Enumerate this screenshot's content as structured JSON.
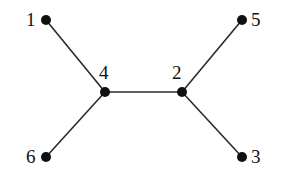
{
  "diagram": {
    "type": "undirected-graph",
    "title": "",
    "background_color": "#ffffff",
    "edge_color": "#2b2b2b",
    "vertex_color": "#101010",
    "label_color": "#111111",
    "vertex_radius": 5,
    "edge_width": 1.6,
    "vertices": [
      {
        "id": "1",
        "label": "1",
        "x": 46,
        "y": 20,
        "label_x": 26,
        "label_y": 10,
        "label_anchor": "left"
      },
      {
        "id": "2",
        "label": "2",
        "x": 182,
        "y": 92,
        "label_x": 172,
        "label_y": 63,
        "label_anchor": "above"
      },
      {
        "id": "3",
        "label": "3",
        "x": 242,
        "y": 157,
        "label_x": 251,
        "label_y": 147,
        "label_anchor": "right"
      },
      {
        "id": "4",
        "label": "4",
        "x": 105,
        "y": 92,
        "label_x": 99,
        "label_y": 63,
        "label_anchor": "above"
      },
      {
        "id": "5",
        "label": "5",
        "x": 242,
        "y": 20,
        "label_x": 251,
        "label_y": 10,
        "label_anchor": "right"
      },
      {
        "id": "6",
        "label": "6",
        "x": 46,
        "y": 157,
        "label_x": 26,
        "label_y": 147,
        "label_anchor": "left"
      }
    ],
    "edges": [
      {
        "id": "edge-1-4",
        "from": "1",
        "to": "4",
        "x1": 46,
        "y1": 20,
        "x2": 105,
        "y2": 92
      },
      {
        "id": "edge-6-4",
        "from": "6",
        "to": "4",
        "x1": 46,
        "y1": 157,
        "x2": 105,
        "y2": 92
      },
      {
        "id": "edge-4-2",
        "from": "4",
        "to": "2",
        "x1": 105,
        "y1": 92,
        "x2": 182,
        "y2": 92
      },
      {
        "id": "edge-2-5",
        "from": "2",
        "to": "5",
        "x1": 182,
        "y1": 92,
        "x2": 242,
        "y2": 20
      },
      {
        "id": "edge-2-3",
        "from": "2",
        "to": "3",
        "x1": 182,
        "y1": 92,
        "x2": 242,
        "y2": 157
      }
    ]
  }
}
